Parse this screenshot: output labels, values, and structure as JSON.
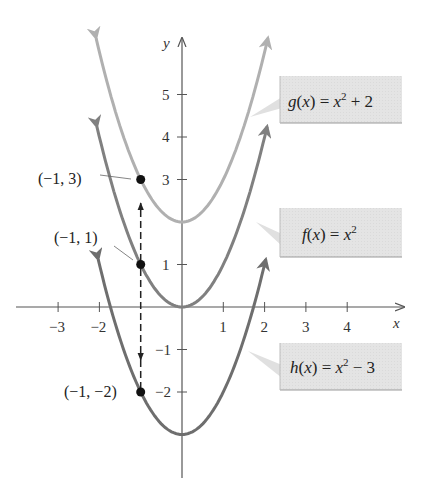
{
  "chart_data": {
    "type": "line",
    "title": "",
    "xlabel": "x",
    "ylabel": "y",
    "xlim": [
      -4,
      5
    ],
    "ylim": [
      -4,
      6
    ],
    "grid": false,
    "x_ticks": [
      -3,
      -2,
      1,
      2,
      3,
      4
    ],
    "x_tick_labels": [
      "−3",
      "−2",
      "1",
      "2",
      "3",
      "4"
    ],
    "y_ticks": [
      -2,
      -1,
      1,
      3,
      4,
      5
    ],
    "y_tick_labels": [
      "−2",
      "−1",
      "1",
      "3",
      "4",
      "5"
    ],
    "series": [
      {
        "name": "g(x) = x² + 2",
        "formula": "x^2 + 2",
        "color": "#b0b0b0",
        "x": [
          -2,
          -1,
          0,
          1,
          2
        ],
        "y": [
          6,
          3,
          2,
          3,
          6
        ]
      },
      {
        "name": "f(x) = x²",
        "formula": "x^2",
        "color": "#808080",
        "x": [
          -2,
          -1,
          0,
          1,
          2
        ],
        "y": [
          4,
          1,
          0,
          1,
          4
        ]
      },
      {
        "name": "h(x) = x² − 3",
        "formula": "x^2 - 3",
        "color": "#6e6e6e",
        "x": [
          -2,
          -1,
          0,
          1,
          2
        ],
        "y": [
          1,
          -2,
          -3,
          -2,
          1
        ]
      }
    ],
    "annotations": [
      {
        "label": "(−1, 3)",
        "x": -1,
        "y": 3
      },
      {
        "label": "(−1, 1)",
        "x": -1,
        "y": 1
      },
      {
        "label": "(−1, −2)",
        "x": -1,
        "y": -2
      },
      {
        "type": "dashed-arrow",
        "from": [
          -1,
          1
        ],
        "to": [
          -1,
          3
        ],
        "note": "shift up 2"
      },
      {
        "type": "dashed-arrow",
        "from": [
          -1,
          1
        ],
        "to": [
          -1,
          -2
        ],
        "note": "shift down 3"
      }
    ],
    "legend_position": "right, callout boxes"
  },
  "axes": {
    "x_label": "x",
    "y_label": "y"
  },
  "labels": {
    "g": {
      "name": "g",
      "arg": "x",
      "rhs_base": "x",
      "exp": "2",
      "rhs_tail": " + 2"
    },
    "f": {
      "name": "f",
      "arg": "x",
      "rhs_base": "x",
      "exp": "2",
      "rhs_tail": ""
    },
    "h": {
      "name": "h",
      "arg": "x",
      "rhs_base": "x",
      "exp": "2",
      "rhs_tail": " − 3"
    }
  },
  "points": {
    "p1": "(−1, 3)",
    "p2": "(−1, 1)",
    "p3": "(−1, −2)"
  },
  "colors": {
    "g_curve": "#b0b0b0",
    "f_curve": "#808080",
    "h_curve": "#6e6e6e",
    "box_fill": "#e3e3e3",
    "axis": "#555555"
  }
}
